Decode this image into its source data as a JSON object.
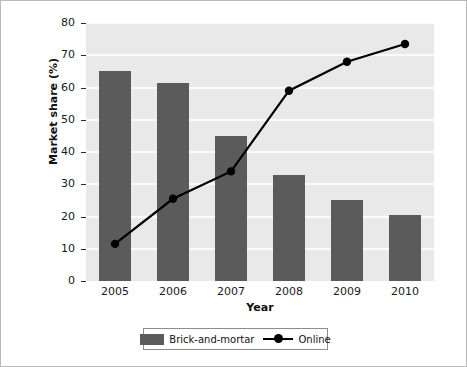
{
  "chart_data": {
    "type": "bar",
    "title": "",
    "subtitle": "",
    "xlabel": "Year",
    "ylabel": "Market share (%)",
    "categories": [
      "2005",
      "2006",
      "2007",
      "2008",
      "2009",
      "2010"
    ],
    "xlim": [
      null,
      null
    ],
    "ylim": [
      0,
      80
    ],
    "yticks": [
      0,
      10,
      20,
      30,
      40,
      50,
      60,
      70,
      80
    ],
    "ytick_labels": [
      "0",
      "10",
      "20",
      "30",
      "40",
      "50",
      "60",
      "70",
      "80"
    ],
    "grid": "horizontal-white-gridlines",
    "legend_position": "below-axes-center",
    "series": [
      {
        "name": "Brick-and-mortar",
        "type": "bar",
        "color": "#5b5b5b",
        "values": [
          65,
          61.5,
          45,
          33,
          25,
          20.5
        ]
      },
      {
        "name": "Online",
        "type": "line",
        "color": "#000000",
        "marker": "circle",
        "values": [
          11.5,
          25.5,
          34,
          59,
          68,
          73.5
        ]
      }
    ]
  },
  "axes": {
    "y_title": "Market share (%)",
    "x_title": "Year",
    "y_tick_labels": [
      "80",
      "70",
      "60",
      "50",
      "40",
      "30",
      "20",
      "10",
      "0"
    ],
    "x_tick_labels": [
      "2005",
      "2006",
      "2007",
      "2008",
      "2009",
      "2010"
    ]
  },
  "legend": {
    "items": [
      {
        "label": "Brick-and-mortar",
        "marker": "swatch",
        "color": "#5b5b5b"
      },
      {
        "label": "Online",
        "marker": "line-circle",
        "color": "#000000"
      }
    ]
  },
  "colors": {
    "bar": "#5b5b5b",
    "line": "#000000",
    "plot_background": "#e9e9e9",
    "gridline": "#fbfbfb",
    "figure_background": "#ffffff",
    "frame_border": "#b9b9b9"
  }
}
